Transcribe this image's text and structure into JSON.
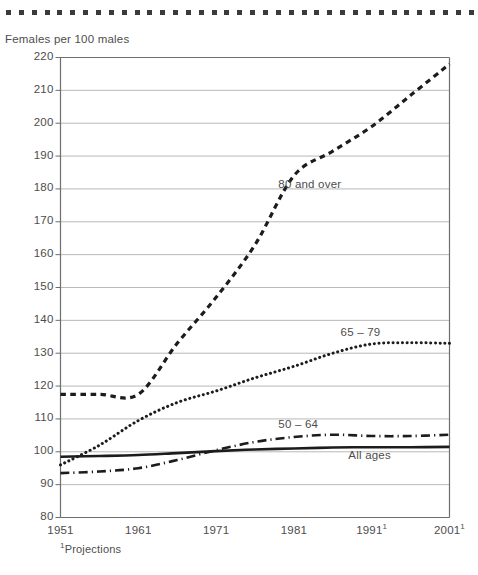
{
  "chart_data": {
    "type": "line",
    "title": "",
    "ylabel": "Females per 100 males",
    "xlabel": "",
    "ylim": [
      80,
      220
    ],
    "ytick_step": 10,
    "yticks": [
      220,
      210,
      200,
      190,
      180,
      170,
      160,
      150,
      140,
      130,
      120,
      110,
      100,
      90,
      80
    ],
    "x": [
      1951,
      1961,
      1971,
      1981,
      1991,
      2001
    ],
    "xtick_labels": [
      "1951",
      "1961",
      "1971",
      "1981",
      "1991",
      "2001"
    ],
    "xtick_footnote_marks": [
      "",
      "",
      "",
      "",
      "1",
      "1"
    ],
    "grid": "horizontal",
    "legend_position": "inline-labels",
    "footnote": "Projections",
    "footnote_mark": "1",
    "series": [
      {
        "name": "80 and over",
        "label": "80 and over",
        "style": "dashed-bold",
        "color": "#1c1c1c",
        "label_x": 1979,
        "label_y": 181,
        "x": [
          1951,
          1956,
          1961,
          1966,
          1971,
          1976,
          1981,
          1986,
          1991,
          1996,
          2001
        ],
        "values": [
          117.5,
          117.5,
          117.5,
          133.0,
          147.0,
          163.0,
          184.0,
          191.5,
          199.0,
          208.5,
          218.0
        ]
      },
      {
        "name": "65-79",
        "label": "65 – 79",
        "style": "dotted",
        "color": "#1c1c1c",
        "label_x": 1987,
        "label_y": 136,
        "x": [
          1951,
          1956,
          1961,
          1966,
          1971,
          1976,
          1981,
          1986,
          1991,
          1996,
          2001
        ],
        "values": [
          96.0,
          102.0,
          109.5,
          115.0,
          118.5,
          122.5,
          126.0,
          130.0,
          132.8,
          133.2,
          133.0
        ]
      },
      {
        "name": "50-64",
        "label": "50 – 64",
        "style": "dash-dot",
        "color": "#1c1c1c",
        "label_x": 1979,
        "label_y": 108,
        "x": [
          1951,
          1956,
          1961,
          1966,
          1971,
          1976,
          1981,
          1986,
          1991,
          1996,
          2001
        ],
        "values": [
          93.5,
          94.0,
          95.0,
          97.5,
          100.5,
          103.0,
          104.5,
          105.2,
          104.8,
          104.8,
          105.2
        ]
      },
      {
        "name": "All ages",
        "label": "All ages",
        "style": "solid",
        "color": "#1c1c1c",
        "label_x": 1988,
        "label_y": 98.5,
        "x": [
          1951,
          1956,
          1961,
          1966,
          1971,
          1976,
          1981,
          1986,
          1991,
          1996,
          2001
        ],
        "values": [
          98.5,
          98.7,
          99.0,
          99.6,
          100.2,
          100.7,
          101.0,
          101.3,
          101.4,
          101.4,
          101.5
        ]
      }
    ]
  },
  "decoration": {
    "top_dot_count": 37,
    "top_dot_color": "#3b3b3b"
  },
  "colors": {
    "axis": "#6e6e6e",
    "grid": "#b9b9b9",
    "text": "#4d4d4d",
    "ink": "#1c1c1c"
  }
}
